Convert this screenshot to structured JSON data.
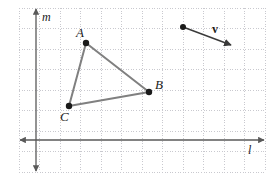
{
  "figure": {
    "kind": "geometry-coordinate-grid",
    "width": 276,
    "height": 184,
    "background_color": "#ffffff"
  },
  "grid": {
    "visible": true,
    "style": "dotted",
    "color": "#c9c9cf",
    "spacing_px": 20.5,
    "left_px": 19,
    "right_px": 265,
    "top_px": 8,
    "bottom_px": 172,
    "columns": 12,
    "rows": 8
  },
  "axes": {
    "color": "#595959",
    "horizontal": {
      "name": "l",
      "label": "l",
      "label_x": 248,
      "label_y": 144,
      "y_px": 140,
      "x_start_px": 20,
      "x_end_px": 264,
      "double_arrow": true
    },
    "vertical": {
      "name": "m",
      "label": "m",
      "label_x": 42,
      "label_y": 11,
      "x_px": 36,
      "y_start_px": 9,
      "y_end_px": 171,
      "double_arrow": true
    }
  },
  "triangle": {
    "name": "triangle-ABC",
    "stroke_color": "#808080",
    "stroke_width": 2,
    "fill": "none",
    "vertices": [
      {
        "label": "A",
        "x": 86,
        "y": 43,
        "label_x": 76,
        "label_y": 26
      },
      {
        "label": "B",
        "x": 149,
        "y": 92,
        "label_x": 155,
        "label_y": 78
      },
      {
        "label": "C",
        "x": 69,
        "y": 106,
        "label_x": 60,
        "label_y": 110
      }
    ],
    "edges": [
      {
        "from": "A",
        "to": "B"
      },
      {
        "from": "B",
        "to": "C"
      },
      {
        "from": "C",
        "to": "A"
      }
    ],
    "point_color": "#1a1a1a",
    "point_radius": 3.2
  },
  "vector": {
    "name": "v",
    "label": "v",
    "label_x": 212,
    "label_y": 23,
    "stroke_color": "#3a3a3a",
    "stroke_width": 1.4,
    "tail": {
      "x": 183,
      "y": 27
    },
    "head": {
      "x": 231,
      "y": 45
    },
    "tail_point_radius": 3.0,
    "arrowhead": true
  }
}
